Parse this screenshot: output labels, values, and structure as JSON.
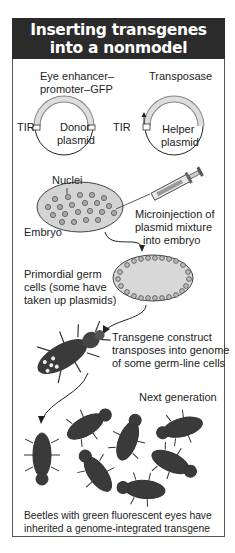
{
  "title": {
    "line1": "Inserting transgenes",
    "line2": "into a nonmodel organism"
  },
  "plasmids": {
    "donor_construct_label_1": "Eye enhancer–",
    "donor_construct_label_2": "promoter–GFP",
    "helper_construct_label": "Transposase",
    "tir_left": "TIR",
    "tir_right": "TIR",
    "donor_name_1": "Donor",
    "donor_name_2": "plasmid",
    "helper_name_1": "Helper",
    "helper_name_2": "plasmid"
  },
  "embryo": {
    "nuclei_label": "Nuclei",
    "embryo_label": "Embryo",
    "injection_1": "Microinjection of",
    "injection_2": "plasmid mixture",
    "injection_3": "into embryo"
  },
  "germ": {
    "line1": "Primordial germ",
    "line2": "cells (some have",
    "line3": "taken up plasmids)"
  },
  "transpose": {
    "line1": "Transgene construct",
    "line2": "transposes into genome",
    "line3": "of some germ-line cells"
  },
  "next_generation": "Next generation",
  "caption": {
    "line1": "Beetles with green fluorescent eyes have",
    "line2": "inherited a genome-integrated transgene"
  },
  "colors": {
    "title_bg": "#2b2b2b",
    "plasmid_band": "#d8d8d8",
    "embryo_fill": "#d4d4d4",
    "beetle": "#3a3a3a"
  }
}
